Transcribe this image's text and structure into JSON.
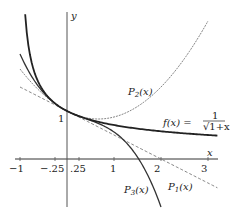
{
  "chart_data": {
    "type": "line",
    "title": "",
    "xlabel": "x",
    "ylabel": "y",
    "xlim": [
      -1,
      3.2
    ],
    "ylim": [
      -1,
      3.1
    ],
    "x_ticks": [
      -1,
      -0.25,
      0.25,
      1,
      2,
      3
    ],
    "x_tick_labels": [
      "−1",
      "−.25",
      ".25",
      "1",
      "2",
      "3"
    ],
    "y_ticks": [
      1
    ],
    "y_tick_labels": [
      "1"
    ],
    "grid": false,
    "series": [
      {
        "name": "f(x) = 1/√(1+x)",
        "formula": "1/sqrt(1+x)",
        "style": "solid-bold",
        "domain": [
          -0.89,
          3.2
        ]
      },
      {
        "name": "P1(x)",
        "formula": "1 - x/2",
        "style": "dashed",
        "domain": [
          -1,
          3.2
        ]
      },
      {
        "name": "P2(x)",
        "formula": "1 - x/2 + 3x^2/8",
        "style": "dashed-thin",
        "domain": [
          -1,
          3
        ]
      },
      {
        "name": "P3(x)",
        "formula": "1 - x/2 + 3x^2/8 - 5x^3/16",
        "style": "solid",
        "domain": [
          -1,
          2
        ]
      }
    ],
    "annotations": [
      {
        "text": "P2(x)",
        "near": [
          1.5,
          1.2
        ]
      },
      {
        "text": "f(x) = 1/√(1+x)",
        "near": [
          2.4,
          0.8
        ]
      },
      {
        "text": "P1(x)",
        "near": [
          2.4,
          -0.6
        ]
      },
      {
        "text": "P3(x)",
        "near": [
          1.3,
          -0.75
        ]
      }
    ]
  },
  "labels": {
    "x_axis": "x",
    "y_axis": "y",
    "y_one": "1",
    "ticks": [
      "−1",
      "−.25",
      ".25",
      "1",
      "2",
      "3"
    ],
    "p1": "P",
    "p1_sub": "1",
    "p2": "P",
    "p2_sub": "2",
    "p3": "P",
    "p3_sub": "3",
    "arg": "(x)",
    "f_lhs": "f(x) = ",
    "f_num": "1",
    "f_den": "√1+x"
  }
}
